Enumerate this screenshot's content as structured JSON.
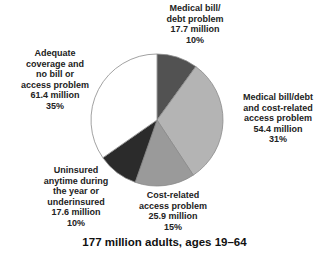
{
  "chart_data": {
    "type": "pie",
    "title": "",
    "caption": "177 million adults, ages 19–64",
    "total_millions": 177,
    "start_angle": "12 o'clock, clockwise",
    "slices": [
      {
        "label": "Medical bill/ debt problem",
        "value_millions": 17.7,
        "percent": 10,
        "color": "#525252"
      },
      {
        "label": "Medical bill/debt and cost-related access problem",
        "value_millions": 54.4,
        "percent": 31,
        "color": "#b4b4b4"
      },
      {
        "label": "Cost-related access problem",
        "value_millions": 25.9,
        "percent": 15,
        "color": "#9a9a9a"
      },
      {
        "label": "Uninsured anytime during the year or underinsured",
        "value_millions": 17.6,
        "percent": 10,
        "color": "#2b2b2b"
      },
      {
        "label": "Adequate coverage and no bill or access problem",
        "value_millions": 61.4,
        "percent": 35,
        "color": "#ffffff"
      }
    ]
  },
  "labels": {
    "medical_bill": {
      "l1": "Medical bill/",
      "l2": "debt problem",
      "l3": "17.7 million",
      "l4": "10%"
    },
    "both": {
      "l1": "Medical bill/debt",
      "l2": "and cost-related",
      "l3": "access problem",
      "l4": "54.4 million",
      "l5": "31%"
    },
    "cost": {
      "l1": "Cost-related",
      "l2": "access problem",
      "l3": "25.9 million",
      "l4": "15%"
    },
    "uninsured": {
      "l1": "Uninsured",
      "l2": "anytime during",
      "l3": "the year or",
      "l4": "underinsured",
      "l5": "17.6 million",
      "l6": "10%"
    },
    "adequate": {
      "l1": "Adequate",
      "l2": "coverage and",
      "l3": "no bill or",
      "l4": "access problem",
      "l5": "61.4 million",
      "l6": "35%"
    }
  },
  "caption": "177 million adults, ages 19–64"
}
